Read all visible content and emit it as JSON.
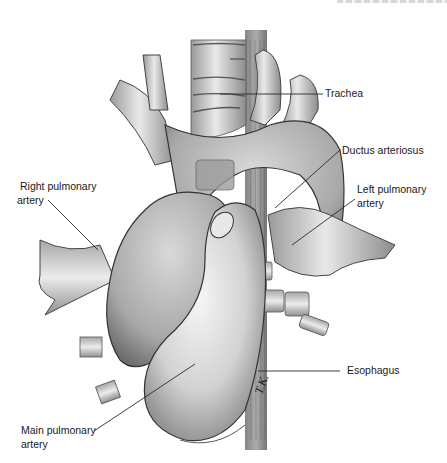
{
  "figure": {
    "type": "anatomical-illustration",
    "artist_initials": "T.K."
  },
  "labels": {
    "trachea": "Trachea",
    "ductus_arteriosus": "Ductus arteriosus",
    "right_pulmonary_artery_line1": "Right pulmonary",
    "right_pulmonary_artery_line2": "artery",
    "left_pulmonary_artery_line1": "Left pulmonary",
    "left_pulmonary_artery_line2": "artery",
    "esophagus": "Esophagus",
    "main_pulmonary_artery_line1": "Main pulmonary",
    "main_pulmonary_artery_line2": "artery"
  },
  "colors": {
    "background": "#ffffff",
    "text": "#1a1a1a",
    "leader_line": "#2a2a2a",
    "vessel_light": "#e6e6e6",
    "vessel_mid": "#bdbdbd",
    "vessel_dark": "#7a7a7a",
    "outline": "#3a3a3a"
  }
}
